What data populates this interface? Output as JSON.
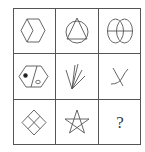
{
  "puzzle": {
    "type": "3x3 figure reasoning matrix",
    "rows": 3,
    "cols": 3,
    "line_color": "#555555",
    "cells": [
      {
        "row": 0,
        "col": 0,
        "figure": "vertical hexagon with inner chevron line"
      },
      {
        "row": 0,
        "col": 1,
        "figure": "triangle inscribed in circle"
      },
      {
        "row": 0,
        "col": 2,
        "figure": "two overlapping ellipses with horizontal line"
      },
      {
        "row": 1,
        "col": 0,
        "figure": "hexagon split by diagonal with black dot and white oval"
      },
      {
        "row": 1,
        "col": 1,
        "figure": "fan of lines from one point"
      },
      {
        "row": 1,
        "col": 2,
        "figure": "crossing curve and line"
      },
      {
        "row": 2,
        "col": 0,
        "figure": "diamond divided into four small diamonds"
      },
      {
        "row": 2,
        "col": 1,
        "figure": "five-pointed star"
      },
      {
        "row": 2,
        "col": 2,
        "figure": "unknown",
        "label": "?"
      }
    ]
  }
}
